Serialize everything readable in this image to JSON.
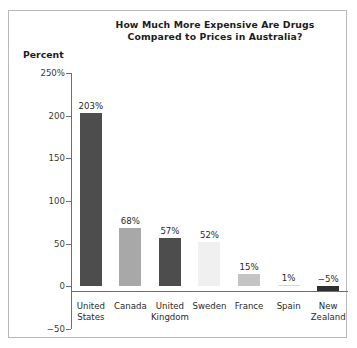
{
  "chart_data": {
    "type": "bar",
    "title": "How Much More Expensive Are Drugs Compared to Prices in Australia?",
    "title_line1": "How Much More Expensive Are Drugs",
    "title_line2": "Compared to Prices in Australia?",
    "ylabel": "Percent",
    "xlabel": "",
    "ylim": [
      -50,
      250
    ],
    "grid": false,
    "legend": null,
    "yticks": [
      250,
      200,
      150,
      100,
      50,
      0,
      -50
    ],
    "ytick_labels": [
      "250%",
      "200",
      "150",
      "100",
      "50",
      "0",
      "-50"
    ],
    "categories": [
      "United States",
      "Canada",
      "United Kingdom",
      "Sweden",
      "France",
      "Spain",
      "New Zealand"
    ],
    "category_lines": [
      [
        "United",
        "States"
      ],
      [
        "Canada",
        ""
      ],
      [
        "United",
        "Kingdom"
      ],
      [
        "Sweden",
        ""
      ],
      [
        "France",
        ""
      ],
      [
        "Spain",
        ""
      ],
      [
        "New",
        "Zealand"
      ]
    ],
    "values": [
      203,
      68,
      57,
      52,
      15,
      1,
      -5
    ],
    "value_labels": [
      "203%",
      "68%",
      "57%",
      "52%",
      "15%",
      "1%",
      "-5%"
    ],
    "bar_colors": [
      "#4d4d4d",
      "#a8a8a8",
      "#4d4d4d",
      "#f0f0f0",
      "#c4c4c4",
      "#d8d8d8",
      "#2f2f2f"
    ]
  },
  "colors": {
    "background": "#ffffff",
    "border": "#b9b9b9",
    "axis": "#6e6e6e",
    "text": "#1c1c1c",
    "tick_text": "#3a3a3a"
  }
}
